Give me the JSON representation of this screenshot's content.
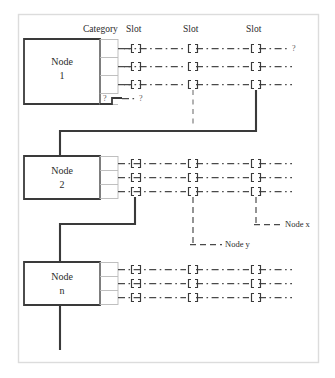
{
  "figure": {
    "type": "diagram",
    "background_color": "#ffffff",
    "frame_color": "#d8d8d8",
    "line_color": "#3a3a3a",
    "dash_color": "#4a4a4a",
    "cell_border_color": "#b9b9b9",
    "text_color": "#2b2b2b"
  },
  "headers": [
    {
      "label": "Category",
      "x": 86
    },
    {
      "label": "Slot",
      "x": 127
    },
    {
      "label": "Slot",
      "x": 184
    },
    {
      "label": "Slot",
      "x": 247
    }
  ],
  "nodes": [
    {
      "id": "node-1",
      "name_line1": "Node",
      "name_line2": "1",
      "rows": 3,
      "has_question_row": true,
      "question_cell_label": "?",
      "question_stub_label": "?"
    },
    {
      "id": "node-2",
      "name_line1": "Node",
      "name_line2": "2",
      "rows": 3,
      "has_question_row": false
    },
    {
      "id": "node-n",
      "name_line1": "Node",
      "name_line2": "n",
      "rows": 3,
      "has_question_row": false
    }
  ],
  "row_terminators": {
    "node1_row1_label": "?"
  },
  "annotations": [
    {
      "id": "node-x",
      "label": "Node x"
    },
    {
      "id": "node-y",
      "label": "Node y"
    }
  ]
}
